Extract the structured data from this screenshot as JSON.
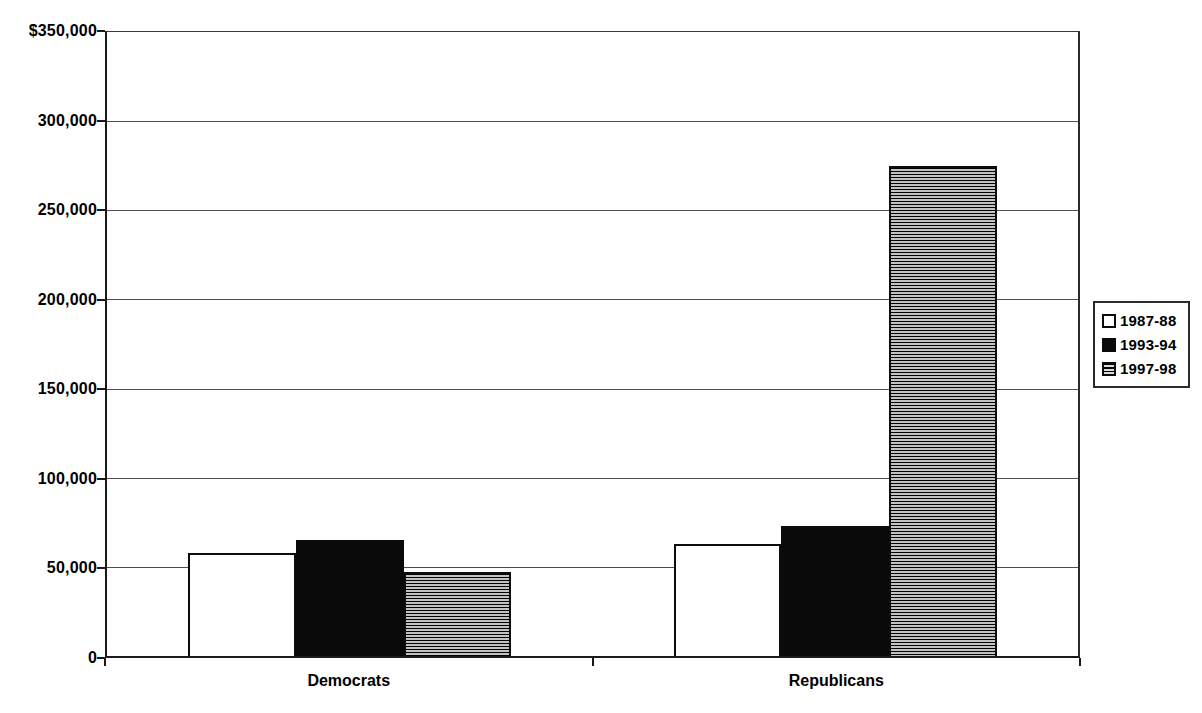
{
  "chart": {
    "background_color": "#ffffff",
    "axis_color": "#1a1a1a",
    "grid_color": "#4f4f4f",
    "bar_border_color": "#0d0d0d"
  },
  "chart_data": {
    "type": "bar",
    "title": "",
    "xlabel": "",
    "ylabel": "",
    "categories": [
      "Democrats",
      "Republicans"
    ],
    "series": [
      {
        "name": "1987-88",
        "pattern": "white",
        "values": [
          58000,
          63000
        ]
      },
      {
        "name": "1993-94",
        "pattern": "black",
        "values": [
          65000,
          73000
        ]
      },
      {
        "name": "1997-98",
        "pattern": "hstripe",
        "values": [
          47000,
          275000
        ]
      }
    ],
    "ylim": [
      0,
      350000
    ],
    "ytick_step": 50000,
    "ytick_labels": [
      "$350,000",
      "300,000",
      "250,000",
      "200,000",
      "150,000",
      "100,000",
      "50,000",
      "0"
    ],
    "grid": true,
    "legend_position": "right",
    "legend_entries": [
      "1987-88",
      "1993-94",
      "1997-98"
    ]
  }
}
